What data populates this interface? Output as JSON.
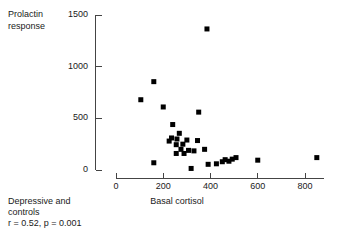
{
  "figure": {
    "ylabel_line1": "Prolactin",
    "ylabel_line2": "response",
    "xlabel": "Basal cortisol",
    "caption_line1": "Depressive and",
    "caption_line2": "controls",
    "caption_line3": "r = 0.52, p = 0.001",
    "axis_color": "#444444",
    "marker_color": "#000000"
  },
  "chart_data": {
    "type": "scatter",
    "title": "",
    "xlabel": "Basal cortisol",
    "ylabel": "Prolactin response",
    "xlim": [
      0,
      880
    ],
    "ylim": [
      0,
      1500
    ],
    "xticks": [
      0,
      200,
      400,
      600,
      800
    ],
    "yticks": [
      0,
      500,
      1000,
      1500
    ],
    "xtick_labels": [
      "0",
      "200",
      "400",
      "600",
      "800"
    ],
    "ytick_labels": [
      "0",
      "500",
      "1000",
      "1500"
    ],
    "grid": false,
    "legend": false,
    "annotations": [
      "Depressive and controls",
      "r = 0.52, p = 0.001"
    ],
    "marker": "square",
    "marker_size": 5,
    "points": [
      {
        "x": 385,
        "y": 1365
      },
      {
        "x": 160,
        "y": 855
      },
      {
        "x": 105,
        "y": 680
      },
      {
        "x": 200,
        "y": 610
      },
      {
        "x": 350,
        "y": 560
      },
      {
        "x": 240,
        "y": 440
      },
      {
        "x": 268,
        "y": 355
      },
      {
        "x": 235,
        "y": 310
      },
      {
        "x": 258,
        "y": 300
      },
      {
        "x": 300,
        "y": 290
      },
      {
        "x": 345,
        "y": 285
      },
      {
        "x": 225,
        "y": 280
      },
      {
        "x": 255,
        "y": 245
      },
      {
        "x": 283,
        "y": 250
      },
      {
        "x": 275,
        "y": 200
      },
      {
        "x": 307,
        "y": 190
      },
      {
        "x": 330,
        "y": 185
      },
      {
        "x": 255,
        "y": 160
      },
      {
        "x": 288,
        "y": 160
      },
      {
        "x": 375,
        "y": 200
      },
      {
        "x": 318,
        "y": 15
      },
      {
        "x": 160,
        "y": 70
      },
      {
        "x": 390,
        "y": 55
      },
      {
        "x": 425,
        "y": 60
      },
      {
        "x": 450,
        "y": 80
      },
      {
        "x": 462,
        "y": 100
      },
      {
        "x": 478,
        "y": 85
      },
      {
        "x": 492,
        "y": 105
      },
      {
        "x": 508,
        "y": 120
      },
      {
        "x": 600,
        "y": 95
      },
      {
        "x": 850,
        "y": 120
      }
    ]
  }
}
